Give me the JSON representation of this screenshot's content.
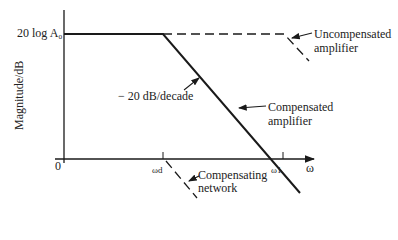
{
  "diagram": {
    "type": "bode-magnitude-plot",
    "y_axis": {
      "label": "Magnitude/dB",
      "tick_top": "20 log A₀",
      "origin": "0"
    },
    "x_axis": {
      "label": "ω",
      "ticks": [
        "ωd",
        "ω1"
      ]
    },
    "annotations": {
      "slope": "− 20 dB/decade",
      "uncompensated": [
        "Uncompensated",
        "amplifier"
      ],
      "compensated": [
        "Compensated",
        "amplifier"
      ],
      "network": [
        "Compensating",
        "network"
      ]
    },
    "colors": {
      "line": "#1a1a1a",
      "background": "#ffffff"
    }
  }
}
